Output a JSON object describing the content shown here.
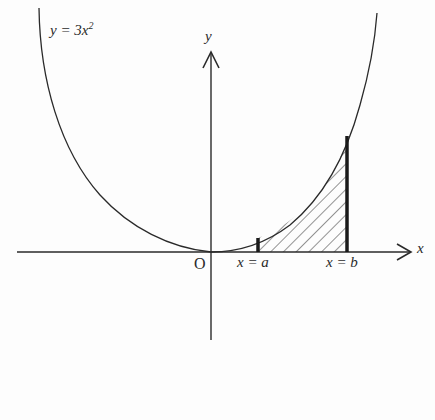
{
  "figure": {
    "equation_label": "y = 3x",
    "equation_exponent": "2",
    "axis_x_label": "x",
    "axis_y_label": "y",
    "origin_label": "O",
    "bound_a_label": "x = a",
    "bound_b_label": "x = b",
    "shaded_region": "area under y = 3x^2 between x = a and x = b"
  },
  "colors": {
    "line": "#2a2a2a",
    "background": "#fdfdfd"
  }
}
